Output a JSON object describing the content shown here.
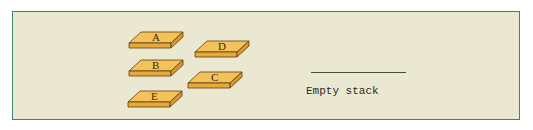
{
  "figure": {
    "blocks": [
      {
        "label": "A",
        "x": 129,
        "y": 29
      },
      {
        "label": "D",
        "x": 195,
        "y": 38
      },
      {
        "label": "B",
        "x": 129,
        "y": 57
      },
      {
        "label": "C",
        "x": 188,
        "y": 69
      },
      {
        "label": "E",
        "x": 128,
        "y": 88
      }
    ],
    "stack": {
      "label": "Empty stack"
    },
    "colors": {
      "panel_bg": "#ebe8d1",
      "panel_border": "#3f8474",
      "block_top": "#f5c25a",
      "block_front": "#e8a93a",
      "block_outline": "#5a4010"
    }
  }
}
